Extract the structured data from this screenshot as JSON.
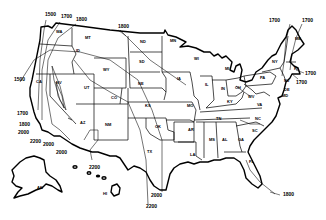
{
  "map": {
    "type": "isoline-map",
    "region": "United States",
    "colors": {
      "line": "#000000",
      "background": "#ffffff"
    },
    "state_labels": [
      {
        "id": "WA",
        "text": "WA",
        "x": 56,
        "y": 33
      },
      {
        "id": "MT",
        "text": "MT",
        "x": 85,
        "y": 39
      },
      {
        "id": "ID",
        "text": "ID",
        "x": 76,
        "y": 52
      },
      {
        "id": "WY",
        "text": "WY",
        "x": 103,
        "y": 71
      },
      {
        "id": "NV",
        "text": "NV",
        "x": 56,
        "y": 84
      },
      {
        "id": "CA",
        "text": "CA",
        "x": 36,
        "y": 83
      },
      {
        "id": "UT",
        "text": "UT",
        "x": 84,
        "y": 89
      },
      {
        "id": "CO",
        "text": "CO",
        "x": 111,
        "y": 99
      },
      {
        "id": "AZ",
        "text": "AZ",
        "x": 80,
        "y": 124
      },
      {
        "id": "NM",
        "text": "NM",
        "x": 105,
        "y": 126
      },
      {
        "id": "ND",
        "text": "ND",
        "x": 140,
        "y": 43
      },
      {
        "id": "SD",
        "text": "SD",
        "x": 139,
        "y": 63
      },
      {
        "id": "NE",
        "text": "NE",
        "x": 138,
        "y": 85
      },
      {
        "id": "KS",
        "text": "KS",
        "x": 145,
        "y": 107
      },
      {
        "id": "OK",
        "text": "OK",
        "x": 155,
        "y": 128
      },
      {
        "id": "TX",
        "text": "TX",
        "x": 147,
        "y": 153
      },
      {
        "id": "MN",
        "text": "MN",
        "x": 170,
        "y": 42
      },
      {
        "id": "IA",
        "text": "IA",
        "x": 177,
        "y": 80
      },
      {
        "id": "MO",
        "text": "MO",
        "x": 187,
        "y": 107
      },
      {
        "id": "AR",
        "text": "AR",
        "x": 188,
        "y": 131
      },
      {
        "id": "LA",
        "text": "LA",
        "x": 190,
        "y": 156
      },
      {
        "id": "WI",
        "text": "WI",
        "x": 194,
        "y": 60
      },
      {
        "id": "IL",
        "text": "IL",
        "x": 205,
        "y": 86
      },
      {
        "id": "MI",
        "text": "MI",
        "x": 225,
        "y": 70
      },
      {
        "id": "IN",
        "text": "IN",
        "x": 221,
        "y": 90
      },
      {
        "id": "OH",
        "text": "OH",
        "x": 235,
        "y": 89
      },
      {
        "id": "KY",
        "text": "KY",
        "x": 227,
        "y": 103
      },
      {
        "id": "TN",
        "text": "TN",
        "x": 216,
        "y": 120
      },
      {
        "id": "MS",
        "text": "MS",
        "x": 209,
        "y": 141
      },
      {
        "id": "AL",
        "text": "AL",
        "x": 222,
        "y": 141
      },
      {
        "id": "GA",
        "text": "GA",
        "x": 238,
        "y": 141
      },
      {
        "id": "FL",
        "text": "FL",
        "x": 249,
        "y": 163
      },
      {
        "id": "SC",
        "text": "SC",
        "x": 252,
        "y": 132
      },
      {
        "id": "NC",
        "text": "NC",
        "x": 255,
        "y": 120
      },
      {
        "id": "VA",
        "text": "VA",
        "x": 257,
        "y": 106
      },
      {
        "id": "WV",
        "text": "WV",
        "x": 248,
        "y": 98
      },
      {
        "id": "PA",
        "text": "PA",
        "x": 260,
        "y": 79
      },
      {
        "id": "NY",
        "text": "NY",
        "x": 272,
        "y": 63
      },
      {
        "id": "NJ",
        "text": "NJ",
        "x": 284,
        "y": 82
      },
      {
        "id": "DE",
        "text": "DE",
        "x": 284,
        "y": 91
      },
      {
        "id": "MD",
        "text": "MD",
        "x": 282,
        "y": 97
      },
      {
        "id": "ME",
        "text": "ME",
        "x": 295,
        "y": 40
      },
      {
        "id": "RI",
        "text": "RI",
        "x": 294,
        "y": 70
      },
      {
        "id": "AK",
        "text": "AK",
        "x": 37,
        "y": 189
      },
      {
        "id": "HI",
        "text": "HI",
        "x": 103,
        "y": 195
      }
    ],
    "isoline_labels": [
      {
        "text": "1500",
        "x": 45,
        "y": 16
      },
      {
        "text": "1700",
        "x": 61,
        "y": 18
      },
      {
        "text": "1800",
        "x": 76,
        "y": 21
      },
      {
        "text": "1500",
        "x": 14,
        "y": 81
      },
      {
        "text": "1800",
        "x": 118,
        "y": 28
      },
      {
        "text": "1700",
        "x": 269,
        "y": 22
      },
      {
        "text": "1700",
        "x": 302,
        "y": 22
      },
      {
        "text": "1700",
        "x": 312,
        "y": 72
      },
      {
        "text": "1700",
        "x": 298,
        "y": 81
      },
      {
        "text": "1700",
        "x": 17,
        "y": 115
      },
      {
        "text": "1800",
        "x": 19,
        "y": 126
      },
      {
        "text": "2000",
        "x": 18,
        "y": 134
      },
      {
        "text": "2200",
        "x": 30,
        "y": 143
      },
      {
        "text": "2000",
        "x": 43,
        "y": 146
      },
      {
        "text": "2000",
        "x": 56,
        "y": 154
      },
      {
        "text": "2200",
        "x": 89,
        "y": 169
      },
      {
        "text": "2000",
        "x": 151,
        "y": 197
      },
      {
        "text": "2200",
        "x": 146,
        "y": 208
      },
      {
        "text": "1800",
        "x": 283,
        "y": 196
      }
    ]
  }
}
